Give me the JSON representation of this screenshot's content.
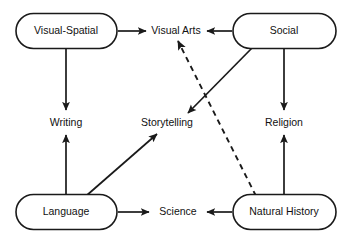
{
  "diagram": {
    "background_color": "#ffffff",
    "stroke_color": "#1a1a1a",
    "nodes": [
      {
        "id": "visual-spatial",
        "label": "Visual-Spatial",
        "shape": "stadium",
        "x": 66,
        "y": 31
      },
      {
        "id": "visual-arts",
        "label": "Visual Arts",
        "shape": "text",
        "x": 176,
        "y": 31
      },
      {
        "id": "social",
        "label": "Social",
        "shape": "stadium",
        "x": 284,
        "y": 31
      },
      {
        "id": "writing",
        "label": "Writing",
        "shape": "text",
        "x": 66,
        "y": 123
      },
      {
        "id": "storytelling",
        "label": "Storytelling",
        "shape": "text",
        "x": 167,
        "y": 123
      },
      {
        "id": "religion",
        "label": "Religion",
        "shape": "text",
        "x": 284,
        "y": 123
      },
      {
        "id": "language",
        "label": "Language",
        "shape": "stadium",
        "x": 66,
        "y": 212
      },
      {
        "id": "science",
        "label": "Science",
        "shape": "text",
        "x": 178,
        "y": 212
      },
      {
        "id": "natural-history",
        "label": "Natural History",
        "shape": "stadium",
        "x": 284,
        "y": 212
      }
    ],
    "edges": [
      {
        "id": "visual-spatial-to-visual-arts",
        "from": "Visual-Spatial",
        "to": "Visual Arts",
        "style": "solid",
        "direction": "right"
      },
      {
        "id": "social-to-visual-arts",
        "from": "Social",
        "to": "Visual Arts",
        "style": "solid",
        "direction": "left"
      },
      {
        "id": "visual-spatial-to-writing",
        "from": "Visual-Spatial",
        "to": "Writing",
        "style": "solid",
        "direction": "down"
      },
      {
        "id": "language-to-writing",
        "from": "Language",
        "to": "Writing",
        "style": "solid",
        "direction": "up"
      },
      {
        "id": "social-to-religion",
        "from": "Social",
        "to": "Religion",
        "style": "solid",
        "direction": "down"
      },
      {
        "id": "natural-history-to-religion",
        "from": "Natural History",
        "to": "Religion",
        "style": "solid",
        "direction": "up"
      },
      {
        "id": "language-to-science",
        "from": "Language",
        "to": "Science",
        "style": "solid",
        "direction": "right"
      },
      {
        "id": "natural-history-to-science",
        "from": "Natural History",
        "to": "Science",
        "style": "solid",
        "direction": "left"
      },
      {
        "id": "language-to-storytelling",
        "from": "Language",
        "to": "Storytelling",
        "style": "solid",
        "direction": "up-right"
      },
      {
        "id": "social-to-storytelling",
        "from": "Social",
        "to": "Storytelling",
        "style": "solid",
        "direction": "down-left"
      },
      {
        "id": "natural-history-to-visual-arts",
        "from": "Natural History",
        "to": "Visual Arts",
        "style": "dashed",
        "direction": "up-left"
      }
    ]
  }
}
